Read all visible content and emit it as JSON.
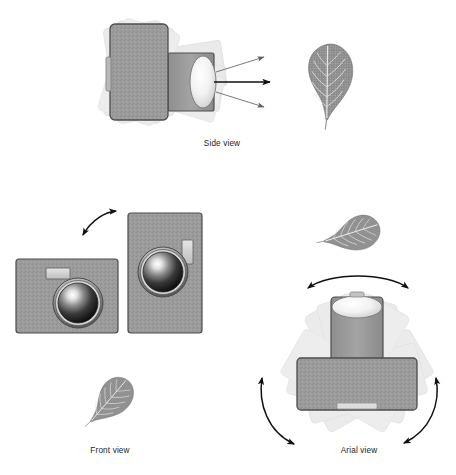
{
  "figure": {
    "background_color": "#ffffff",
    "panels": [
      {
        "id": "side-view",
        "caption": "Side view",
        "caption_x": 222,
        "caption_y": 146,
        "description": "Camera seen from the side with rotated ghost copies and three light-ray arrows leaving the lens, pointing at a leaf subject."
      },
      {
        "id": "front-view",
        "caption": "Front view",
        "caption_x": 110,
        "caption_y": 453,
        "description": "Camera front in landscape orientation and in portrait orientation, linked by a curved double-headed rotation arrow, with a leaf subject below."
      },
      {
        "id": "arial-view",
        "caption": "Arial view",
        "caption_x": 359,
        "caption_y": 453,
        "description": "Camera seen from above with rotated ghost copies and three curved double-headed arrows indicating panning rotation."
      }
    ],
    "subjects": [
      {
        "id": "leaf-side",
        "name": "leaf",
        "rotation_deg": 0,
        "cx": 326,
        "cy": 82
      },
      {
        "id": "leaf-front",
        "name": "leaf",
        "rotation_deg": 40,
        "cx": 108,
        "cy": 400
      },
      {
        "id": "leaf-arial",
        "name": "leaf",
        "rotation_deg": 70,
        "cx": 351,
        "cy": 232
      }
    ],
    "colors": {
      "body_fill": "#9b9b9b",
      "body_stroke": "#4d4d4d",
      "ghost_fill": "#c9c9c9",
      "ghost_stroke": "#b4b4b4",
      "lens_dark": "#1f1f1f",
      "lens_highlight": "#ffffff",
      "lens_ring": "#6f6f6f",
      "flash_fill": "#d9d9d9",
      "arrow_stroke": "#111111",
      "ray_stroke": "#6b6b6b",
      "leaf_fill": "#8f8f8f",
      "leaf_vein": "#e8e8e8",
      "caption_color": "#1d1d1d"
    },
    "cameras": [
      {
        "id": "camera-side",
        "view": "side",
        "orientation": "side profile",
        "ghost_rotations_deg": [
          -9,
          9,
          16
        ],
        "x": 110,
        "y": 24,
        "w": 58,
        "h": 96
      },
      {
        "id": "camera-front-landscape",
        "view": "front",
        "orientation": "landscape",
        "x": 16,
        "y": 259,
        "w": 102,
        "h": 74,
        "flash": "top-left",
        "lens_cx": 78,
        "lens_cy": 303,
        "lens_r": 24
      },
      {
        "id": "camera-front-portrait",
        "view": "front",
        "orientation": "portrait",
        "x": 128,
        "y": 213,
        "w": 74,
        "h": 120,
        "flash": "right",
        "lens_cx": 163,
        "lens_cy": 272,
        "lens_r": 24
      },
      {
        "id": "camera-arial",
        "view": "arial",
        "orientation": "top-down",
        "ghost_rotations_deg": [
          -28,
          -14,
          14,
          28
        ],
        "x": 297,
        "y": 307,
        "w": 120,
        "h": 52
      }
    ],
    "arrows": [
      {
        "id": "ray-center",
        "type": "straight",
        "heads": 1,
        "weight": "bold",
        "from": [
          213,
          82
        ],
        "to": [
          272,
          82
        ]
      },
      {
        "id": "ray-upper",
        "type": "straight",
        "heads": 1,
        "weight": "thin",
        "from": [
          215,
          74
        ],
        "to": [
          265,
          58
        ]
      },
      {
        "id": "ray-lower",
        "type": "straight",
        "heads": 1,
        "weight": "thin",
        "from": [
          215,
          92
        ],
        "to": [
          265,
          106
        ]
      },
      {
        "id": "rotation-front",
        "type": "curved",
        "heads": 2,
        "label": "roll between landscape and portrait"
      },
      {
        "id": "rotation-arial-top",
        "type": "curved",
        "heads": 2,
        "label": "pan arc above camera"
      },
      {
        "id": "rotation-arial-left",
        "type": "curved",
        "heads": 2,
        "label": "pan arc left of camera"
      },
      {
        "id": "rotation-arial-right",
        "type": "curved",
        "heads": 2,
        "label": "pan arc right of camera"
      }
    ]
  }
}
